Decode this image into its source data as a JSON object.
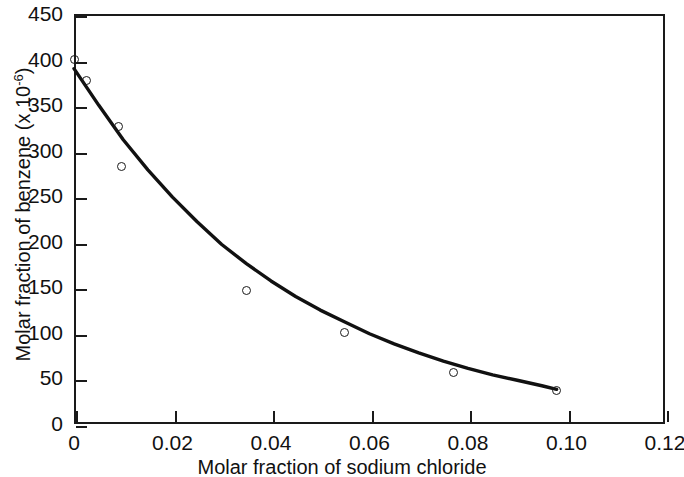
{
  "chart_data": {
    "type": "scatter",
    "title": "",
    "xlabel": "Molar fraction of sodium chloride",
    "ylabel": "Molar fraction of benzene (x 10-6)",
    "ylabel_prefix": "Molar fraction of benzene (x 10",
    "ylabel_exponent": "-6",
    "ylabel_suffix": ")",
    "xlim": [
      0,
      0.12
    ],
    "ylim": [
      0,
      450
    ],
    "xticks": [
      0,
      0.02,
      0.04,
      0.06,
      0.08,
      0.1,
      0.12
    ],
    "xtick_labels": [
      "0",
      "0.02",
      "0.04",
      "0.06",
      "0.08",
      "0.10",
      "0.12"
    ],
    "yticks": [
      0,
      50,
      100,
      150,
      200,
      250,
      300,
      350,
      400,
      450
    ],
    "ytick_labels": [
      "0",
      "50",
      "100",
      "150",
      "200",
      "250",
      "300",
      "350",
      "400",
      "450"
    ],
    "grid": false,
    "legend": false,
    "marker_style": "open-circle",
    "series": [
      {
        "name": "Molar fraction of benzene",
        "x": [
          0.0,
          0.0025,
          0.009,
          0.0097,
          0.035,
          0.055,
          0.077,
          0.098
        ],
        "y": [
          400,
          377,
          327,
          283,
          146,
          100,
          57,
          37
        ]
      }
    ],
    "fit_curve": {
      "name": "fitted decay curve",
      "x": [
        0.0,
        0.005,
        0.01,
        0.015,
        0.02,
        0.025,
        0.03,
        0.035,
        0.04,
        0.045,
        0.05,
        0.055,
        0.06,
        0.065,
        0.07,
        0.075,
        0.08,
        0.085,
        0.09,
        0.095,
        0.098
      ],
      "y": [
        390,
        350,
        312,
        279,
        249,
        222,
        197,
        176,
        157,
        140,
        125,
        112,
        99,
        88,
        78,
        69,
        61,
        54,
        48,
        42,
        38
      ]
    },
    "colors": {
      "axis": "#1a1a1a",
      "curve": "#111111",
      "marker": "#1a1a1a",
      "background": "#ffffff"
    }
  }
}
